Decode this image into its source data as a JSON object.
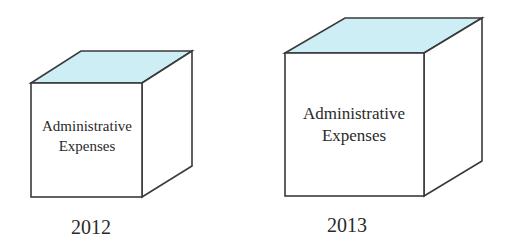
{
  "diagram": {
    "cubes": [
      {
        "year": "2012",
        "line1": "Administrative",
        "line2": "Expenses"
      },
      {
        "year": "2013",
        "line1": "Administrative",
        "line2": "Expenses"
      }
    ],
    "colors": {
      "top_face": "#cdeef5",
      "edge": "#3a3a3a",
      "face": "#ffffff"
    }
  }
}
